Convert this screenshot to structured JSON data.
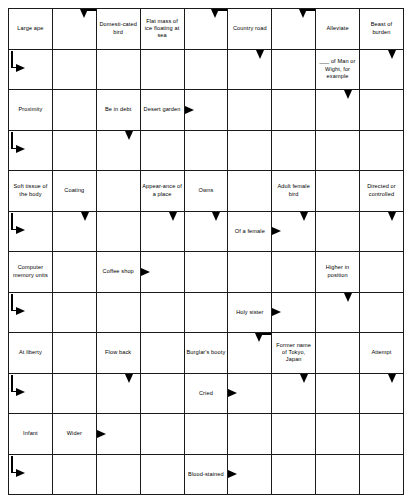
{
  "puzzle": {
    "type": "arrowword-crossword",
    "columns": 8,
    "rows": 12,
    "shaded_color": "#c8c8c8",
    "line_color": "#1a1a1a",
    "background_color": "#ffffff"
  },
  "cells": [
    [
      {
        "clue": "Large ape",
        "arrows": [],
        "shaded": false
      },
      {
        "clue": "",
        "arrows": [
          "cornerdown"
        ],
        "shaded": false
      },
      {
        "clue": "Domesti-cated bird",
        "arrows": [],
        "shaded": false
      },
      {
        "clue": "Flat mass of ice floating at sea",
        "arrows": [],
        "shaded": false
      },
      {
        "clue": "",
        "arrows": [
          "cornerdown"
        ],
        "shaded": false
      },
      {
        "clue": "Country road",
        "arrows": [],
        "shaded": false
      },
      {
        "clue": "",
        "arrows": [
          "cornerdown"
        ],
        "shaded": false
      },
      {
        "clue": "Alleviate",
        "arrows": [],
        "shaded": false
      },
      {
        "clue": "Beast of burden",
        "arrows": [],
        "shaded": false
      }
    ],
    [
      {
        "clue": "",
        "arrows": [
          "elbow"
        ],
        "shaded": true
      },
      {
        "clue": "",
        "arrows": [],
        "shaded": false
      },
      {
        "clue": "",
        "arrows": [],
        "shaded": false
      },
      {
        "clue": "",
        "arrows": [],
        "shaded": false
      },
      {
        "clue": "",
        "arrows": [],
        "shaded": false
      },
      {
        "clue": "",
        "arrows": [
          "down"
        ],
        "shaded": false
      },
      {
        "clue": "",
        "arrows": [],
        "shaded": false
      },
      {
        "clue": "___ of Man or Wight, for example",
        "arrows": [],
        "shaded": false
      },
      {
        "clue": "",
        "arrows": [
          "down"
        ],
        "shaded": false
      }
    ],
    [
      {
        "clue": "Proximity",
        "arrows": [],
        "shaded": false
      },
      {
        "clue": "",
        "arrows": [],
        "shaded": false
      },
      {
        "clue": "Be in debt",
        "arrows": [],
        "shaded": false
      },
      {
        "clue": "Desert garden",
        "arrows": [],
        "shaded": false
      },
      {
        "clue": "",
        "arrows": [
          "right"
        ],
        "shaded": false
      },
      {
        "clue": "",
        "arrows": [],
        "shaded": false
      },
      {
        "clue": "",
        "arrows": [],
        "shaded": false
      },
      {
        "clue": "",
        "arrows": [
          "down"
        ],
        "shaded": true
      },
      {
        "clue": "",
        "arrows": [],
        "shaded": false
      }
    ],
    [
      {
        "clue": "",
        "arrows": [
          "elbow"
        ],
        "shaded": false
      },
      {
        "clue": "",
        "arrows": [],
        "shaded": false
      },
      {
        "clue": "",
        "arrows": [
          "down"
        ],
        "shaded": false
      },
      {
        "clue": "",
        "arrows": [],
        "shaded": false
      },
      {
        "clue": "",
        "arrows": [],
        "shaded": false
      },
      {
        "clue": "",
        "arrows": [],
        "shaded": false
      },
      {
        "clue": "",
        "arrows": [],
        "shaded": false
      },
      {
        "clue": "",
        "arrows": [],
        "shaded": false
      },
      {
        "clue": "",
        "arrows": [],
        "shaded": false
      }
    ],
    [
      {
        "clue": "Soft tissue of the body",
        "arrows": [],
        "shaded": false
      },
      {
        "clue": "Coating",
        "arrows": [],
        "shaded": false
      },
      {
        "clue": "",
        "arrows": [],
        "shaded": false
      },
      {
        "clue": "Appear-ance of a place",
        "arrows": [],
        "shaded": false
      },
      {
        "clue": "Owns",
        "arrows": [],
        "shaded": false
      },
      {
        "clue": "",
        "arrows": [],
        "shaded": false
      },
      {
        "clue": "Adult female bird",
        "arrows": [],
        "shaded": false
      },
      {
        "clue": "",
        "arrows": [],
        "shaded": false
      },
      {
        "clue": "Directed or controlled",
        "arrows": [],
        "shaded": false
      }
    ],
    [
      {
        "clue": "",
        "arrows": [
          "elbow"
        ],
        "shaded": false
      },
      {
        "clue": "",
        "arrows": [
          "down"
        ],
        "shaded": false
      },
      {
        "clue": "",
        "arrows": [],
        "shaded": true
      },
      {
        "clue": "",
        "arrows": [
          "down"
        ],
        "shaded": false
      },
      {
        "clue": "",
        "arrows": [
          "down"
        ],
        "shaded": false
      },
      {
        "clue": "Of a female",
        "arrows": [],
        "shaded": false
      },
      {
        "clue": "",
        "arrows": [
          "right",
          "down"
        ],
        "shaded": false
      },
      {
        "clue": "",
        "arrows": [],
        "shaded": false
      },
      {
        "clue": "",
        "arrows": [
          "down"
        ],
        "shaded": false
      }
    ],
    [
      {
        "clue": "Computer memory units",
        "arrows": [],
        "shaded": false
      },
      {
        "clue": "",
        "arrows": [],
        "shaded": false
      },
      {
        "clue": "Coffee shop",
        "arrows": [],
        "shaded": false
      },
      {
        "clue": "",
        "arrows": [
          "right"
        ],
        "shaded": false
      },
      {
        "clue": "",
        "arrows": [],
        "shaded": false
      },
      {
        "clue": "",
        "arrows": [],
        "shaded": false
      },
      {
        "clue": "",
        "arrows": [],
        "shaded": false
      },
      {
        "clue": "Higher in position",
        "arrows": [],
        "shaded": false
      },
      {
        "clue": "",
        "arrows": [],
        "shaded": false
      }
    ],
    [
      {
        "clue": "",
        "arrows": [
          "elbow"
        ],
        "shaded": false
      },
      {
        "clue": "",
        "arrows": [],
        "shaded": false
      },
      {
        "clue": "",
        "arrows": [],
        "shaded": false
      },
      {
        "clue": "",
        "arrows": [],
        "shaded": false
      },
      {
        "clue": "",
        "arrows": [],
        "shaded": false
      },
      {
        "clue": "Holy sister",
        "arrows": [],
        "shaded": false
      },
      {
        "clue": "",
        "arrows": [
          "right"
        ],
        "shaded": false
      },
      {
        "clue": "",
        "arrows": [
          "down"
        ],
        "shaded": false
      },
      {
        "clue": "",
        "arrows": [],
        "shaded": true
      }
    ],
    [
      {
        "clue": "At liberty",
        "arrows": [],
        "shaded": false
      },
      {
        "clue": "",
        "arrows": [],
        "shaded": true
      },
      {
        "clue": "Flow back",
        "arrows": [],
        "shaded": false
      },
      {
        "clue": "",
        "arrows": [],
        "shaded": false
      },
      {
        "clue": "Burglar's booty",
        "arrows": [],
        "shaded": false
      },
      {
        "clue": "",
        "arrows": [
          "cornerdown"
        ],
        "shaded": false
      },
      {
        "clue": "Former name of Tokyo, Japan",
        "arrows": [],
        "shaded": false
      },
      {
        "clue": "",
        "arrows": [],
        "shaded": false
      },
      {
        "clue": "Attempt",
        "arrows": [],
        "shaded": false
      }
    ],
    [
      {
        "clue": "",
        "arrows": [
          "elbow"
        ],
        "shaded": false
      },
      {
        "clue": "",
        "arrows": [],
        "shaded": false
      },
      {
        "clue": "",
        "arrows": [
          "down"
        ],
        "shaded": false
      },
      {
        "clue": "",
        "arrows": [],
        "shaded": false
      },
      {
        "clue": "Cried",
        "arrows": [],
        "shaded": false
      },
      {
        "clue": "",
        "arrows": [
          "right"
        ],
        "shaded": false
      },
      {
        "clue": "",
        "arrows": [
          "down"
        ],
        "shaded": false
      },
      {
        "clue": "",
        "arrows": [],
        "shaded": false
      },
      {
        "clue": "",
        "arrows": [
          "down"
        ],
        "shaded": false
      }
    ],
    [
      {
        "clue": "Infant",
        "arrows": [],
        "shaded": false
      },
      {
        "clue": "Wider",
        "arrows": [],
        "shaded": false
      },
      {
        "clue": "",
        "arrows": [
          "right"
        ],
        "shaded": false
      },
      {
        "clue": "",
        "arrows": [],
        "shaded": false
      },
      {
        "clue": "",
        "arrows": [],
        "shaded": false
      },
      {
        "clue": "",
        "arrows": [],
        "shaded": false
      },
      {
        "clue": "",
        "arrows": [],
        "shaded": true
      },
      {
        "clue": "",
        "arrows": [],
        "shaded": false
      },
      {
        "clue": "",
        "arrows": [],
        "shaded": false
      }
    ],
    [
      {
        "clue": "",
        "arrows": [
          "elbow"
        ],
        "shaded": false
      },
      {
        "clue": "",
        "arrows": [],
        "shaded": false
      },
      {
        "clue": "",
        "arrows": [],
        "shaded": false
      },
      {
        "clue": "",
        "arrows": [],
        "shaded": false
      },
      {
        "clue": "Blood-stained",
        "arrows": [],
        "shaded": false
      },
      {
        "clue": "",
        "arrows": [
          "right"
        ],
        "shaded": false
      },
      {
        "clue": "",
        "arrows": [],
        "shaded": false
      },
      {
        "clue": "",
        "arrows": [],
        "shaded": false
      },
      {
        "clue": "",
        "arrows": [],
        "shaded": false
      }
    ]
  ]
}
